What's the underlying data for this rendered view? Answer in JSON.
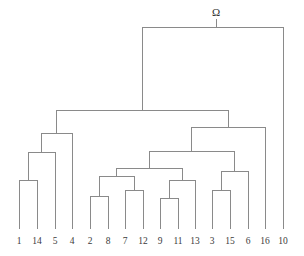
{
  "figure": {
    "kind": "dendrogram",
    "background_color": "#ffffff",
    "line_color": "#8a8a8a",
    "label_color": "#3b3b3b",
    "root_label_color": "#2f2f2f"
  },
  "root": {
    "label": "Ω",
    "label_x": 216,
    "label_y": 16,
    "tick_x": 216,
    "tick_y1": 19,
    "tick_y2": 27
  },
  "chart_data": {
    "type": "dendrogram",
    "title": "",
    "xlabel": "",
    "ylabel": "",
    "orientation": "top-down",
    "leaf_count": 16,
    "leaf_order": [
      "1",
      "14",
      "5",
      "4",
      "2",
      "8",
      "7",
      "12",
      "9",
      "11",
      "13",
      "3",
      "15",
      "6",
      "16",
      "10"
    ],
    "leaf_x": [
      19,
      37,
      55,
      72,
      90,
      108,
      125,
      143,
      160,
      178,
      195,
      212,
      230,
      248,
      265,
      283
    ],
    "leaf_baseline_y": 229,
    "label_y": 244,
    "merges": [
      {
        "id": "m1",
        "name": "merge-1-14",
        "children": [
          "1",
          "14"
        ],
        "x1": 19,
        "x2": 37,
        "y": 180
      },
      {
        "id": "m2",
        "name": "merge-1-14-5",
        "children": [
          "m1",
          "5"
        ],
        "x1": 28,
        "x2": 55,
        "y": 152
      },
      {
        "id": "m3",
        "name": "merge-1-14-5-4",
        "children": [
          "m2",
          "4"
        ],
        "x1": 41,
        "x2": 72,
        "y": 133
      },
      {
        "id": "m4",
        "name": "merge-2-8",
        "children": [
          "2",
          "8"
        ],
        "x1": 90,
        "x2": 108,
        "y": 196
      },
      {
        "id": "m5",
        "name": "merge-7-12",
        "children": [
          "7",
          "12"
        ],
        "x1": 125,
        "x2": 143,
        "y": 190
      },
      {
        "id": "m6",
        "name": "merge-2-8-7-12",
        "children": [
          "m4",
          "m5"
        ],
        "x1": 99,
        "x2": 134,
        "y": 176
      },
      {
        "id": "m7",
        "name": "merge-9-11",
        "children": [
          "9",
          "11"
        ],
        "x1": 160,
        "x2": 178,
        "y": 198
      },
      {
        "id": "m8",
        "name": "merge-9-11-13",
        "children": [
          "m7",
          "13"
        ],
        "x1": 169,
        "x2": 195,
        "y": 180
      },
      {
        "id": "m9",
        "name": "merge-middle-cluster",
        "children": [
          "m6",
          "m8"
        ],
        "x1": 116,
        "x2": 182,
        "y": 168
      },
      {
        "id": "m10",
        "name": "merge-3-15",
        "children": [
          "3",
          "15"
        ],
        "x1": 212,
        "x2": 230,
        "y": 190
      },
      {
        "id": "m11",
        "name": "merge-3-15-6",
        "children": [
          "m10",
          "6"
        ],
        "x1": 221,
        "x2": 248,
        "y": 171
      },
      {
        "id": "m12",
        "name": "merge-middle-with-3-15-6",
        "children": [
          "m9",
          "m11"
        ],
        "x1": 149,
        "x2": 234,
        "y": 151
      },
      {
        "id": "m13",
        "name": "merge-right-with-16",
        "children": [
          "m12",
          "16"
        ],
        "x1": 191,
        "x2": 265,
        "y": 127
      },
      {
        "id": "m14",
        "name": "merge-left-right",
        "children": [
          "m3",
          "m13"
        ],
        "x1": 56,
        "x2": 228,
        "y": 110
      },
      {
        "id": "m15",
        "name": "root-merge-with-10",
        "children": [
          "m14",
          "10"
        ],
        "x1": 142,
        "x2": 283,
        "y": 27
      }
    ]
  }
}
